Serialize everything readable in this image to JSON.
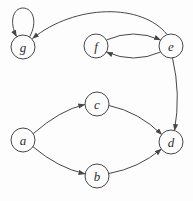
{
  "diagram": {
    "type": "directed-graph",
    "background": "#fdfdfd",
    "edge_color": "#474747",
    "node_stroke": "#474747",
    "node_fill": "#fdfdfd",
    "node_radius": 12,
    "nodes": [
      {
        "id": "g",
        "label": "g",
        "x": 23,
        "y": 47
      },
      {
        "id": "f",
        "label": "f",
        "x": 96,
        "y": 46
      },
      {
        "id": "e",
        "label": "e",
        "x": 171,
        "y": 46
      },
      {
        "id": "c",
        "label": "c",
        "x": 97,
        "y": 104
      },
      {
        "id": "a",
        "label": "a",
        "x": 23,
        "y": 140
      },
      {
        "id": "d",
        "label": "d",
        "x": 171,
        "y": 142
      },
      {
        "id": "b",
        "label": "b",
        "x": 97,
        "y": 176
      }
    ],
    "edges": [
      {
        "from": "g",
        "to": "g",
        "kind": "self-loop",
        "path": "M 29.5 37 C 38 22 33 8 23 8 C 13 8 9 22 16.5 36.5"
      },
      {
        "from": "e",
        "to": "g",
        "kind": "arc",
        "path": "M 167 34.5 C 142 3 75 4 32.5 38.5"
      },
      {
        "from": "f",
        "to": "e",
        "kind": "arc",
        "path": "M 106.4 40 Q 133.5 28 160.6 40"
      },
      {
        "from": "e",
        "to": "f",
        "kind": "arc",
        "path": "M 160.6 52 Q 133.5 64 106.4 52"
      },
      {
        "from": "e",
        "to": "d",
        "kind": "arc",
        "path": "M 172.5 58 Q 181 94 174.5 130.5"
      },
      {
        "from": "a",
        "to": "c",
        "kind": "arc",
        "path": "M 32.8 134 Q 60 110 84.8 104.5"
      },
      {
        "from": "c",
        "to": "d",
        "kind": "arc",
        "path": "M 109 105.5 Q 139 112 161.8 134.6"
      },
      {
        "from": "a",
        "to": "b",
        "kind": "arc",
        "path": "M 32.8 146.6 Q 58 168 85 173.8"
      },
      {
        "from": "b",
        "to": "d",
        "kind": "arc",
        "path": "M 109 173.5 Q 139 168 161.3 149"
      }
    ]
  }
}
